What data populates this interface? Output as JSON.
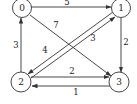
{
  "diagram": {
    "type": "directed-weighted-graph",
    "colors": {
      "stroke": "#333333",
      "text": "#222222",
      "background": "#ffffff"
    },
    "nodes": [
      {
        "id": "0",
        "label": "0",
        "x": 22,
        "y": 8
      },
      {
        "id": "1",
        "label": "1",
        "x": 121,
        "y": 8
      },
      {
        "id": "2",
        "label": "2",
        "x": 21,
        "y": 82
      },
      {
        "id": "3",
        "label": "3",
        "x": 119,
        "y": 82
      }
    ],
    "edges": [
      {
        "from": "0",
        "to": "1",
        "weight": "5"
      },
      {
        "from": "0",
        "to": "3",
        "weight": "7"
      },
      {
        "from": "1",
        "to": "3",
        "weight": "2"
      },
      {
        "from": "2",
        "to": "0",
        "weight": "3"
      },
      {
        "from": "1",
        "to": "2",
        "weight": "4"
      },
      {
        "from": "2",
        "to": "1",
        "weight": "3"
      },
      {
        "from": "2",
        "to": "3",
        "weight": "2"
      },
      {
        "from": "3",
        "to": "2",
        "weight": "1"
      }
    ]
  }
}
